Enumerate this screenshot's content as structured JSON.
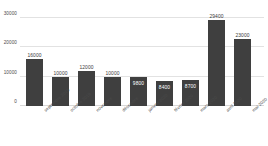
{
  "chart_data": {
    "type": "bar",
    "title": "",
    "subtitle": "",
    "xlabel": "",
    "ylabel": "",
    "categories": [
      "septembre 2019",
      "octobre 2019",
      "novembre",
      "décembre",
      "janvier 2020",
      "février 2020",
      "mars 2020",
      "avril 2020",
      "mai 2020"
    ],
    "values": [
      16000,
      10000,
      12000,
      10000,
      9800,
      8400,
      8700,
      29400,
      23000
    ],
    "data_labels": [
      "16000",
      "10000",
      "12000",
      "10000",
      "9800",
      "8400",
      "8700",
      "29400",
      "23000"
    ],
    "label_placement": [
      "outside",
      "outside",
      "outside",
      "outside",
      "inside",
      "inside",
      "inside",
      "outside",
      "outside"
    ],
    "ylim": [
      0,
      30000
    ],
    "yticks": [
      0,
      10000,
      20000,
      30000
    ],
    "ytick_labels": [
      "0",
      "10000",
      "20000",
      "30000"
    ],
    "grid": true,
    "legend": false,
    "bar_color": "#3f3f3f",
    "gridline_color": "#e2e2e2",
    "background_color": "#ffffff",
    "text_color": "#4a4a4a",
    "inside_label_color": "#ffffff"
  }
}
